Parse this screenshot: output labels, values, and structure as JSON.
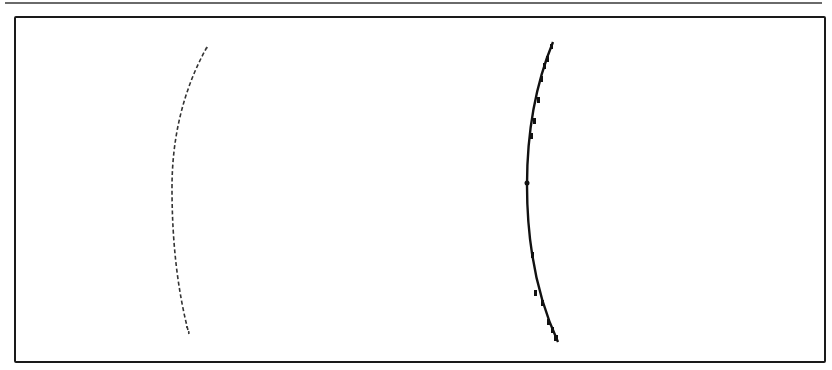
{
  "figure": {
    "header_rule": {
      "color": "#6a6a6a"
    },
    "frame": {
      "color": "#1a1a1a"
    },
    "curves": [
      {
        "name": "left-arc",
        "style": "dotted-thin",
        "color": "#333333",
        "top": [
          207,
          47
        ],
        "apex": [
          172,
          188
        ],
        "bottom": [
          189,
          334
        ]
      },
      {
        "name": "right-arc",
        "style": "solid-stepped-thick",
        "color": "#111111",
        "top": [
          553,
          42
        ],
        "apex": [
          527,
          185
        ],
        "bottom": [
          558,
          342
        ],
        "marker": [
          527,
          183
        ]
      }
    ]
  }
}
